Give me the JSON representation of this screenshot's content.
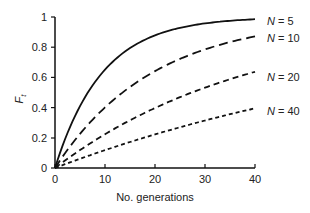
{
  "chart_data": {
    "type": "line",
    "title": "",
    "xlabel": "No. generations",
    "ylabel": "F_t",
    "xlim": [
      0,
      40
    ],
    "ylim": [
      0,
      1
    ],
    "xticks": [
      0,
      10,
      20,
      30,
      40
    ],
    "yticks": [
      0,
      0.2,
      0.4,
      0.6,
      0.8,
      1
    ],
    "ytick_labels": [
      "0",
      "0.2",
      "0.4",
      "0.6",
      "0.8",
      "1"
    ],
    "grid": false,
    "legend_position": "right, inline at line ends",
    "x": [
      0,
      5,
      10,
      15,
      20,
      25,
      30,
      35,
      40
    ],
    "series": [
      {
        "name": "N = 5",
        "style": "solid",
        "values": [
          0,
          0.41,
          0.65,
          0.79,
          0.88,
          0.93,
          0.96,
          0.98,
          0.985
        ]
      },
      {
        "name": "N = 10",
        "style": "long-dashed",
        "values": [
          0,
          0.23,
          0.4,
          0.54,
          0.64,
          0.72,
          0.79,
          0.83,
          0.87
        ]
      },
      {
        "name": "N = 20",
        "style": "medium-dashed",
        "values": [
          0,
          0.12,
          0.22,
          0.32,
          0.4,
          0.47,
          0.53,
          0.59,
          0.63
        ]
      },
      {
        "name": "N = 40",
        "style": "short-dashed",
        "values": [
          0,
          0.06,
          0.12,
          0.17,
          0.22,
          0.27,
          0.31,
          0.36,
          0.39
        ]
      }
    ]
  },
  "labels": {
    "xlabel": "No. generations",
    "ylabel_main": "F",
    "ylabel_sub": "t",
    "legend": [
      {
        "prefix": "N",
        "suffix": " = 5"
      },
      {
        "prefix": "N",
        "suffix": " = 10"
      },
      {
        "prefix": "N",
        "suffix": " = 20"
      },
      {
        "prefix": "N",
        "suffix": " = 40"
      }
    ],
    "xticks": [
      "0",
      "10",
      "20",
      "30",
      "40"
    ],
    "yticks": [
      "0",
      "0.2",
      "0.4",
      "0.6",
      "0.8",
      "1"
    ]
  }
}
